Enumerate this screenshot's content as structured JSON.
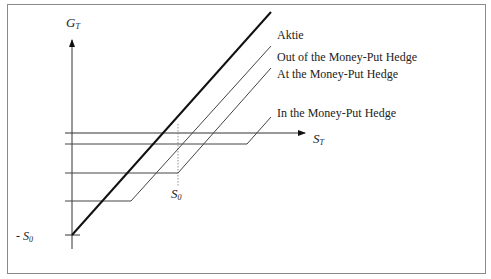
{
  "diagram": {
    "axes": {
      "y_label": "G",
      "y_label_sub": "T",
      "x_label": "S",
      "x_label_sub": "T"
    },
    "markers": {
      "s0_label": "S",
      "s0_sub": "0",
      "neg_s0_prefix": "- ",
      "neg_s0_label": "S",
      "neg_s0_sub": "0"
    },
    "legend": [
      {
        "label": "Aktie"
      },
      {
        "label": "Out of the Money-Put Hedge"
      },
      {
        "label": "At the Money-Put Hedge"
      },
      {
        "label": "In the Money-Put Hedge"
      }
    ],
    "colors": {
      "stock_line": "#111111",
      "hedge_line": "#444444",
      "axis": "#333333",
      "frame": "#8a8a8a"
    }
  }
}
